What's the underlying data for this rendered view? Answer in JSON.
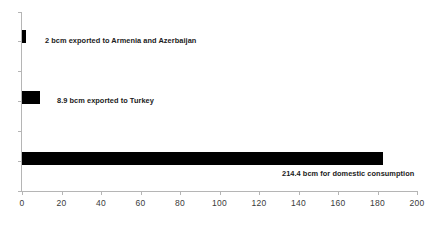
{
  "chart_data": {
    "type": "bar",
    "orientation": "horizontal",
    "title": "",
    "subtitle": "",
    "xlabel": "",
    "ylabel": "",
    "xlim": [
      0,
      200
    ],
    "xticks": [
      0,
      20,
      40,
      60,
      80,
      100,
      120,
      140,
      160,
      180,
      200
    ],
    "xtick_labels": [
      "0",
      "20",
      "40",
      "60",
      "80",
      "100",
      "120",
      "140",
      "160",
      "180",
      "200"
    ],
    "grid": false,
    "legend": null,
    "bar_color": "#000000",
    "axis_color": "#b5b5b5",
    "text_color": "#1b1b1b",
    "categories": [
      "Exported to Armenia and Azerbaijan",
      "Exported to Turkey",
      "Domestic consumption"
    ],
    "values": [
      2,
      8.9,
      214.4
    ],
    "plotted_values": [
      2,
      8.9,
      183
    ],
    "data_labels": [
      "2 bcm exported to Armenia and Azerbaijan",
      "8.9 bcm exported to Turkey",
      "214.4 bcm for domestic consumption"
    ],
    "annotations": [
      {
        "text": "2 bcm exported to Armenia and Azerbaijan",
        "value": 2,
        "unit": "bcm",
        "position": "right-of-bar"
      },
      {
        "text": "8.9 bcm exported to Turkey",
        "value": 8.9,
        "unit": "bcm",
        "position": "right-of-bar"
      },
      {
        "text": "214.4 bcm for domestic consumption",
        "value": 214.4,
        "unit": "bcm",
        "position": "below-bar-right"
      }
    ]
  },
  "axis": {
    "x": {
      "t0": "0",
      "t1": "20",
      "t2": "40",
      "t3": "60",
      "t4": "80",
      "t5": "100",
      "t6": "120",
      "t7": "140",
      "t8": "160",
      "t9": "180",
      "t10": "200"
    }
  },
  "labels": {
    "bar1": "2 bcm exported to Armenia and Azerbaijan",
    "bar2": "8.9 bcm exported to Turkey",
    "bar3": "214.4 bcm for domestic consumption"
  }
}
